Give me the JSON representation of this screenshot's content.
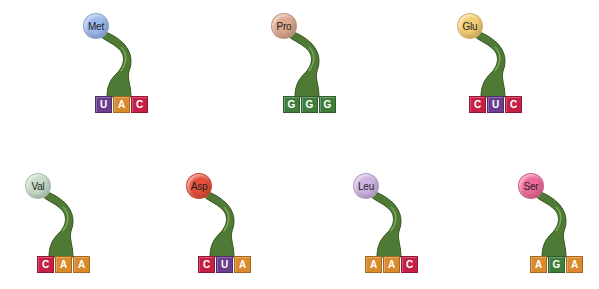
{
  "colors": {
    "U": "#6a3d8f",
    "A": "#d98a2c",
    "C": "#c51f45",
    "G": "#3f7d3c",
    "trna_body": "#4f7a35",
    "trna_body_dark": "#35561f"
  },
  "trnas": [
    {
      "amino_acid": "Met",
      "color": "#9cb9ee",
      "anticodon": [
        "U",
        "A",
        "C"
      ]
    },
    {
      "amino_acid": "Pro",
      "color": "#dba98e",
      "anticodon": [
        "G",
        "G",
        "G"
      ]
    },
    {
      "amino_acid": "Glu",
      "color": "#f4cd72",
      "anticodon": [
        "C",
        "U",
        "C"
      ]
    },
    {
      "amino_acid": "Val",
      "color": "#c6dcc8",
      "anticodon": [
        "C",
        "A",
        "A"
      ]
    },
    {
      "amino_acid": "Asp",
      "color": "#e6503a",
      "anticodon": [
        "C",
        "U",
        "A"
      ]
    },
    {
      "amino_acid": "Leu",
      "color": "#cdb3e2",
      "anticodon": [
        "A",
        "A",
        "C"
      ]
    },
    {
      "amino_acid": "Ser",
      "color": "#ee6a9a",
      "anticodon": [
        "A",
        "G",
        "A"
      ]
    }
  ]
}
